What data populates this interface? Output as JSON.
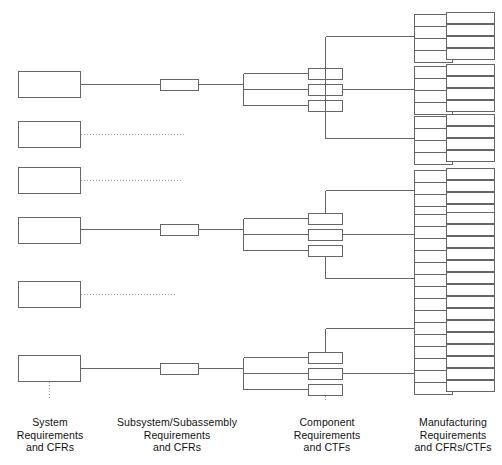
{
  "diagram": {
    "type": "hierarchical-block-tree",
    "stroke_color": "#555555",
    "box_fill": "#ffffff",
    "line_color": "#666666",
    "dotted_line_color": "#999999",
    "columns": [
      {
        "id": "system",
        "label_lines": [
          "System",
          "Requirements",
          "and CFRs"
        ],
        "label_x": 49,
        "label_y": 408,
        "box_w": 62,
        "box_h": 26,
        "boxes": [
          {
            "id": "sys-1",
            "x": 18,
            "y": 71,
            "connected": true,
            "link": "solid"
          },
          {
            "id": "sys-2",
            "x": 18,
            "y": 121,
            "connected": false,
            "link": "dotted"
          },
          {
            "id": "sys-3",
            "x": 18,
            "y": 167,
            "connected": false,
            "link": "dotted"
          },
          {
            "id": "sys-4",
            "x": 18,
            "y": 217,
            "connected": true,
            "link": "solid"
          },
          {
            "id": "sys-5",
            "x": 18,
            "y": 281,
            "connected": false,
            "link": "dotted"
          },
          {
            "id": "sys-6",
            "x": 18,
            "y": 355,
            "connected": true,
            "link": "solid"
          }
        ]
      },
      {
        "id": "subsystem",
        "label_lines": [
          "Subsystem/Subassembly",
          "Requirements",
          "and CFRs"
        ],
        "label_x": 175,
        "label_y": 408,
        "box_w": 38,
        "box_h": 11,
        "boxes": [
          {
            "id": "sub-1",
            "x": 160,
            "y": 79
          },
          {
            "id": "sub-2",
            "x": 160,
            "y": 224
          },
          {
            "id": "sub-3",
            "x": 160,
            "y": 363
          }
        ]
      },
      {
        "id": "component",
        "label_lines": [
          "Component",
          "Requirements",
          "and CTFs"
        ],
        "label_x": 327,
        "label_y": 408,
        "box_w": 34,
        "box_h": 11,
        "groups": [
          {
            "id": "comp-grp-1",
            "boxes": [
              {
                "id": "comp-1a",
                "x": 308,
                "y": 68
              },
              {
                "id": "comp-1b",
                "x": 308,
                "y": 84
              },
              {
                "id": "comp-1c",
                "x": 308,
                "y": 100
              }
            ]
          },
          {
            "id": "comp-grp-2",
            "boxes": [
              {
                "id": "comp-2a",
                "x": 308,
                "y": 213
              },
              {
                "id": "comp-2b",
                "x": 308,
                "y": 229
              },
              {
                "id": "comp-2c",
                "x": 308,
                "y": 245
              }
            ]
          },
          {
            "id": "comp-grp-3",
            "boxes": [
              {
                "id": "comp-3a",
                "x": 308,
                "y": 352
              },
              {
                "id": "comp-3b",
                "x": 308,
                "y": 368
              },
              {
                "id": "comp-3c",
                "x": 308,
                "y": 384
              }
            ]
          }
        ]
      },
      {
        "id": "manufacturing",
        "label_lines": [
          "Manufacturing",
          "Requirements",
          "and CFRs/CTFs"
        ],
        "label_x": 453,
        "label_y": 408,
        "left_box_w": 38,
        "left_box_h": 12,
        "right_box_w": 48,
        "right_box_h": 11,
        "groups": [
          {
            "id": "mfg-grp-1",
            "feeds_from": "comp-1a",
            "y": 16
          },
          {
            "id": "mfg-grp-2",
            "feeds_from": "comp-1b",
            "y": 64
          },
          {
            "id": "mfg-grp-3",
            "feeds_from": "comp-1c",
            "y": 118
          },
          {
            "id": "mfg-grp-4",
            "feeds_from": "comp-2a",
            "y": 196
          },
          {
            "id": "mfg-grp-5",
            "feeds_from": "comp-2b",
            "y": 211
          },
          {
            "id": "mfg-grp-6",
            "feeds_from": "comp-2c",
            "y": 258
          },
          {
            "id": "mfg-grp-7",
            "feeds_from": "comp-3a",
            "y": 308
          },
          {
            "id": "mfg-grp-8",
            "feeds_from": "comp-3b",
            "y": 356
          }
        ]
      }
    ]
  }
}
